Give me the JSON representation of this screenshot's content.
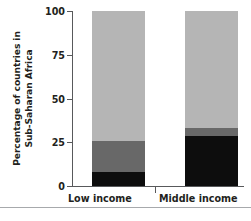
{
  "chart_data": {
    "type": "bar",
    "subtype": "stacked-bar",
    "title": "",
    "xlabel": "",
    "ylabel": "Percentage of countries in Sub-Saharan Africa",
    "ylabel_lines": [
      "Percentage of countries in",
      "Sub-Saharan Africa"
    ],
    "categories": [
      "Low income",
      "Middle income"
    ],
    "ylim": [
      0,
      100
    ],
    "yticks": [
      0,
      25,
      50,
      75,
      100
    ],
    "ytick_labels": [
      "0",
      "25",
      "50",
      "75",
      "100"
    ],
    "grid": false,
    "legend": "none",
    "series": [
      {
        "name": "bottom-segment",
        "color": "#0d0d0d",
        "values": [
          8,
          28.5
        ]
      },
      {
        "name": "middle-segment",
        "color": "#686868",
        "values": [
          18,
          4.5
        ]
      },
      {
        "name": "top-segment",
        "color": "#b5b5b5",
        "values": [
          74,
          67
        ]
      }
    ],
    "cumulative_boundaries": [
      {
        "category": "Low income",
        "breaks": [
          0,
          8,
          26,
          100
        ]
      },
      {
        "category": "Middle income",
        "breaks": [
          0,
          28.5,
          33,
          100
        ]
      }
    ],
    "colors": {
      "dark": "#0d0d0d",
      "medium": "#686868",
      "light": "#b5b5b5",
      "axis": "#58595b",
      "rule": "#a7a9ac",
      "text": "#231f20"
    }
  }
}
